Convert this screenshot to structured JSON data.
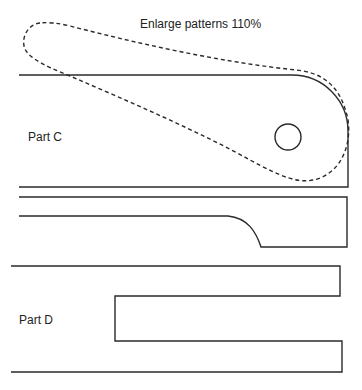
{
  "diagram": {
    "title": "Enlarge patterns 110%",
    "parts": [
      {
        "id": "part-c",
        "label": "Part C"
      },
      {
        "id": "part-c-strip",
        "label": ""
      },
      {
        "id": "part-d",
        "label": "Part D"
      }
    ],
    "line_color": "#2a2a2a",
    "background": "#ffffff"
  }
}
